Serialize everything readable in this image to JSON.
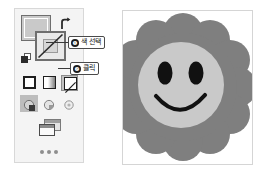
{
  "panel": {
    "name": "tools-panel",
    "swatches": {
      "fill_label": "Fill",
      "stroke_label": "Stroke (None selected)",
      "swap_label": "Swap Fill and Stroke",
      "default_label": "Default Fill and Stroke"
    },
    "fill_modes": [
      {
        "name": "solid-color",
        "label": "Color",
        "selected": false
      },
      {
        "name": "gradient",
        "label": "Gradient",
        "selected": false
      },
      {
        "name": "none",
        "label": "None",
        "selected": true
      }
    ],
    "draw_modes": [
      {
        "name": "draw-normal",
        "label": "Draw Normal",
        "selected": true
      },
      {
        "name": "draw-behind",
        "label": "Draw Behind",
        "selected": false
      },
      {
        "name": "draw-inside",
        "label": "Draw Inside",
        "selected": false
      }
    ],
    "screen_mode_label": "Change Screen Mode",
    "overflow_label": "More Tools"
  },
  "callouts": [
    {
      "number": "❶",
      "text": "색 선택"
    },
    {
      "number": "❷",
      "text": "클릭"
    }
  ],
  "artwork": {
    "name": "smiley-flower",
    "petal_color": "#7f7f7f",
    "face_color": "#c9c9c9",
    "feature_color": "#111111",
    "petal_count": 12
  },
  "colors": {
    "panel_bg": "#f4f4f4",
    "panel_border": "#d8d8d8",
    "selected_bg": "#c2c2c2",
    "outline": "#1e1e1e"
  }
}
